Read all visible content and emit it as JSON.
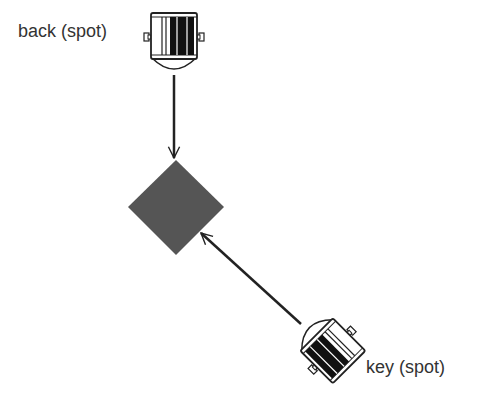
{
  "diagram": {
    "type": "lighting-setup",
    "subject": {
      "shape": "diamond",
      "color": "#555555",
      "center": [
        176,
        207
      ],
      "half_size": 48
    },
    "lights": [
      {
        "id": "back",
        "label": "back (spot)",
        "kind": "spot",
        "position": [
          174,
          40
        ],
        "rotation_deg": 0,
        "arrow": {
          "from": [
            174,
            75
          ],
          "to": [
            174,
            158
          ]
        }
      },
      {
        "id": "key",
        "label": "key (spot)",
        "kind": "spot",
        "position": [
          330,
          348
        ],
        "rotation_deg": 135,
        "arrow": {
          "from": [
            301,
            324
          ],
          "to": [
            201,
            233
          ]
        }
      }
    ],
    "colors": {
      "line": "#222222",
      "fixture_fill": "#111111",
      "fixture_stroke": "#222222",
      "text": "#333333",
      "background": "#ffffff"
    }
  }
}
